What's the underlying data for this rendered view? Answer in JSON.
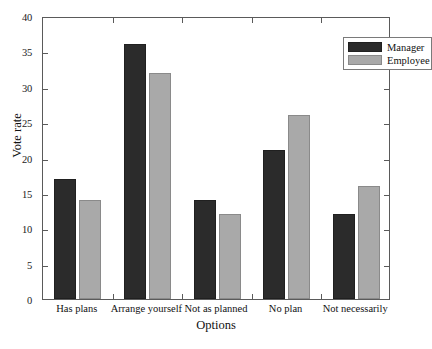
{
  "chart_data": {
    "type": "bar",
    "title": "",
    "xlabel": "Options",
    "ylabel": "Vote rate",
    "categories": [
      "Has plans",
      "Arrange yourself",
      "Not as planned",
      "No plan",
      "Not necessarily"
    ],
    "series": [
      {
        "name": "Manager",
        "color": "#2b2b2b",
        "values": [
          17,
          36,
          14,
          21,
          12
        ]
      },
      {
        "name": "Employee",
        "color": "#a9a9a9",
        "values": [
          14,
          32,
          12,
          26,
          16
        ]
      }
    ],
    "ylim": [
      0,
      40
    ],
    "yticks": [
      0,
      5,
      10,
      15,
      20,
      25,
      30,
      35,
      40
    ],
    "ytick_labels": [
      "0",
      "5",
      "10",
      "15",
      "20",
      "25",
      "30",
      "35",
      "40"
    ],
    "grid": false,
    "legend_position": "top-right",
    "legend_entries": [
      "Manager",
      "Employee"
    ]
  }
}
